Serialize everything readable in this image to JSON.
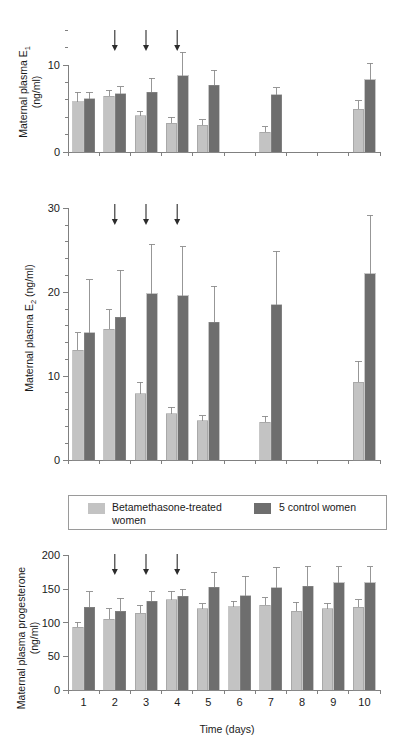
{
  "figure": {
    "xlabel": "Time (days)",
    "days": [
      "1",
      "2",
      "3",
      "4",
      "5",
      "6",
      "7",
      "8",
      "9",
      "10"
    ],
    "arrow_days": [
      2,
      3,
      4
    ],
    "colors": {
      "treated": "#c3c3c3",
      "control": "#6e6e6e",
      "axis": "#808080",
      "error": "#8c8c8c",
      "arrow": "#2b2b2b"
    }
  },
  "legend": {
    "treated_label_line1": "Betamethasone-treated",
    "treated_label_line2": "women",
    "control_label": "5 control women"
  },
  "chart_data": [
    {
      "type": "bar",
      "id": "panel-e1",
      "title": "",
      "ylabel_line1": "Maternal plasma E",
      "ylabel_sub": "1",
      "ylabel_line2": "(ng/ml)",
      "xlabel": "",
      "categories": [
        "1",
        "2",
        "3",
        "4",
        "5",
        "6",
        "7",
        "8",
        "9",
        "10"
      ],
      "ylim": [
        0,
        14.5
      ],
      "yticks": [
        0,
        10
      ],
      "ytick_labels": [
        "0",
        "10"
      ],
      "yminor": [
        2,
        4,
        6,
        8,
        12,
        14
      ],
      "grid": false,
      "legend_position": "below-figure",
      "annotations": [
        {
          "type": "arrow",
          "day": 2
        },
        {
          "type": "arrow",
          "day": 3
        },
        {
          "type": "arrow",
          "day": 4
        }
      ],
      "series": [
        {
          "name": "Betamethasone-treated women",
          "color": "#c3c3c3",
          "values": [
            5.8,
            6.4,
            4.2,
            3.3,
            3.1,
            null,
            2.3,
            null,
            null,
            4.9
          ],
          "errors": [
            1.1,
            0.7,
            0.5,
            0.7,
            0.6,
            null,
            0.6,
            null,
            null,
            1.0
          ]
        },
        {
          "name": "5 control women",
          "color": "#6e6e6e",
          "values": [
            6.1,
            6.7,
            6.9,
            8.8,
            7.7,
            null,
            6.6,
            null,
            null,
            8.3
          ],
          "errors": [
            0.8,
            0.8,
            1.6,
            2.7,
            1.7,
            null,
            0.8,
            null,
            null,
            1.9
          ]
        }
      ]
    },
    {
      "type": "bar",
      "id": "panel-e2",
      "title": "",
      "ylabel_line1": "Maternal plasma E",
      "ylabel_sub": "2",
      "ylabel_line2": " (ng/ml)",
      "xlabel": "",
      "categories": [
        "1",
        "2",
        "3",
        "4",
        "5",
        "6",
        "7",
        "8",
        "9",
        "10"
      ],
      "ylim": [
        0,
        31
      ],
      "yticks": [
        0,
        10,
        20,
        30
      ],
      "ytick_labels": [
        "0",
        "10",
        "20",
        "30"
      ],
      "yminor": [
        2,
        4,
        6,
        8,
        12,
        14,
        16,
        18,
        22,
        24,
        26,
        28
      ],
      "grid": false,
      "legend_position": "below-figure",
      "annotations": [
        {
          "type": "arrow",
          "day": 2
        },
        {
          "type": "arrow",
          "day": 3
        },
        {
          "type": "arrow",
          "day": 4
        }
      ],
      "series": [
        {
          "name": "Betamethasone-treated women",
          "color": "#c3c3c3",
          "values": [
            13.1,
            15.6,
            7.9,
            5.5,
            4.7,
            null,
            4.5,
            null,
            null,
            9.3
          ],
          "errors": [
            2.1,
            2.3,
            1.4,
            0.8,
            0.6,
            null,
            0.7,
            null,
            null,
            2.5
          ]
        },
        {
          "name": "5 control women",
          "color": "#6e6e6e",
          "values": [
            15.2,
            17.0,
            19.8,
            19.6,
            16.4,
            null,
            18.5,
            null,
            null,
            22.2
          ],
          "errors": [
            6.3,
            5.6,
            5.9,
            5.8,
            4.3,
            null,
            6.4,
            null,
            null,
            7.0
          ]
        }
      ]
    },
    {
      "type": "bar",
      "id": "panel-p4",
      "title": "",
      "ylabel_line1": "Maternal plasma progesterone",
      "ylabel_line2": "(ng/ml)",
      "xlabel": "Time (days)",
      "categories": [
        "1",
        "2",
        "3",
        "4",
        "5",
        "6",
        "7",
        "8",
        "9",
        "10"
      ],
      "ylim": [
        0,
        205
      ],
      "yticks": [
        0,
        50,
        100,
        150,
        200
      ],
      "ytick_labels": [
        "0",
        "50",
        "100",
        "150",
        "200"
      ],
      "yminor": [],
      "grid": false,
      "legend_position": "above-panel",
      "annotations": [
        {
          "type": "arrow",
          "day": 2
        },
        {
          "type": "arrow",
          "day": 3
        },
        {
          "type": "arrow",
          "day": 4
        }
      ],
      "series": [
        {
          "name": "Betamethasone-treated women",
          "color": "#c3c3c3",
          "values": [
            93,
            105,
            114,
            134,
            121,
            124,
            126,
            117,
            121,
            123
          ],
          "errors": [
            8,
            16,
            12,
            13,
            7,
            8,
            11,
            13,
            8,
            11
          ]
        },
        {
          "name": "5 control women",
          "color": "#6e6e6e",
          "values": [
            123,
            117,
            132,
            139,
            153,
            140,
            152,
            154,
            159,
            159
          ],
          "errors": [
            23,
            19,
            15,
            11,
            22,
            29,
            30,
            30,
            24,
            24
          ]
        }
      ]
    }
  ]
}
